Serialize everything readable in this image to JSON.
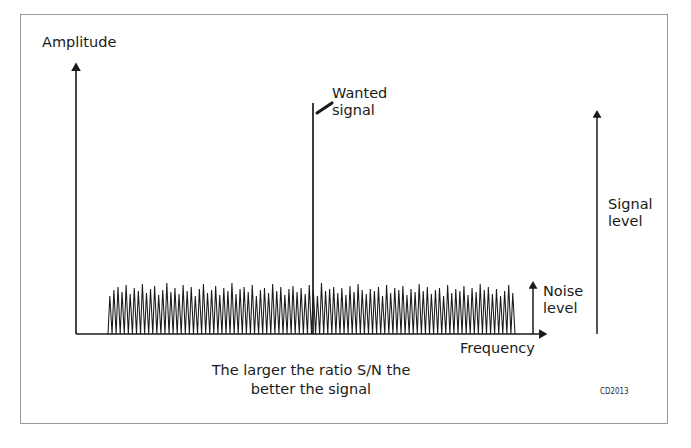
{
  "figure": {
    "id_label": "CD2013",
    "axes": {
      "y_axis_label": "Amplitude",
      "x_axis_label": "Frequency"
    },
    "annotations": {
      "wanted_signal_line1": "Wanted",
      "wanted_signal_line2": "signal",
      "signal_level_line1": "Signal",
      "signal_level_line2": "level",
      "noise_level_line1": "Noise",
      "noise_level_line2": "level"
    },
    "caption_line1": "The larger the ratio S/N the",
    "caption_line2": "better the signal",
    "colors": {
      "ink": "#1a1a1a",
      "frame": "#9a9a9a",
      "background": "#ffffff"
    }
  },
  "chart_data": {
    "type": "line",
    "title": "",
    "xlabel": "Frequency",
    "ylabel": "Amplitude",
    "grid": false,
    "legend": "none",
    "axis_origin": [
      76,
      334
    ],
    "x_axis_end": [
      545,
      334
    ],
    "y_axis_top": [
      76,
      65
    ],
    "noise_band_x_range": [
      108,
      515
    ],
    "noise_baseline_y": 334,
    "noise_peak_y_range": [
      283,
      296
    ],
    "wanted_signal": {
      "x": 313,
      "top_y": 103,
      "baseline_y": 334,
      "amplitude_px": 231
    },
    "measurement_arrows": [
      {
        "name": "noise level",
        "x": 533,
        "from_y": 334,
        "to_y": 283,
        "length_px": 51
      },
      {
        "name": "signal level",
        "x": 597,
        "from_y": 334,
        "to_y": 112,
        "length_px": 222
      }
    ],
    "noise_peak_heights": [
      38,
      44,
      47,
      42,
      49,
      40,
      46,
      43,
      50,
      41,
      45,
      48,
      39,
      44,
      51,
      42,
      46,
      40,
      49,
      43,
      47,
      38,
      45,
      50,
      41,
      44,
      48,
      39,
      46,
      43,
      51,
      40,
      45,
      47,
      42,
      49,
      38,
      44,
      46,
      41,
      50,
      43,
      47,
      39,
      45,
      48,
      42,
      46,
      40,
      49,
      44,
      38,
      51,
      43,
      45,
      47,
      41,
      46,
      39,
      48,
      42,
      50,
      44,
      40,
      45,
      43,
      47,
      38,
      49,
      41,
      46,
      44,
      48,
      39,
      45,
      42,
      50,
      43,
      47,
      40,
      44,
      46,
      38,
      49,
      41,
      45,
      43,
      48,
      39,
      46,
      42,
      50,
      44,
      47,
      40,
      45,
      38,
      43,
      49,
      41
    ]
  }
}
